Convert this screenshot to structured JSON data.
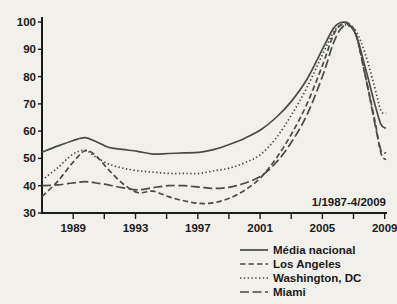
{
  "chart_data": {
    "type": "line",
    "title": "",
    "subtitle": "",
    "xlabel": "",
    "ylabel": "",
    "annotation": "1/1987-4/2009",
    "xlim": [
      1987.0,
      2009.33
    ],
    "ylim": [
      30,
      100
    ],
    "grid": false,
    "legend_position": "bottom-right",
    "y_ticks": [
      30,
      40,
      50,
      60,
      70,
      80,
      90,
      100
    ],
    "y_tick_labels": [
      "30",
      "40",
      "50",
      "60",
      "70",
      "80",
      "90",
      "100"
    ],
    "x_ticks": [
      1989,
      1991,
      1993,
      1995,
      1997,
      1999,
      2001,
      2003,
      2005,
      2007,
      2009
    ],
    "x_tick_labels": [
      "1989",
      "",
      "1993",
      "",
      "1997",
      "",
      "2001",
      "",
      "2005",
      "",
      "2009"
    ],
    "x": [
      1987.0,
      1988.0,
      1989.0,
      1989.8,
      1990.5,
      1991.3,
      1992.2,
      1993.2,
      1994.2,
      1995.2,
      1996.2,
      1997.2,
      1998.2,
      1999.2,
      2000.2,
      2001.2,
      2002.2,
      2003.2,
      2004.2,
      2005.2,
      2005.9,
      2006.4,
      2006.9,
      2007.4,
      2008.0,
      2008.6,
      2009.0,
      2009.33
    ],
    "series": [
      {
        "name": "Média nacional",
        "style": "solid",
        "values": [
          52.3,
          54.5,
          56.5,
          57.6,
          56.2,
          54.1,
          53.3,
          52.6,
          51.6,
          51.8,
          52.0,
          52.2,
          53.3,
          55.2,
          57.5,
          60.5,
          65.0,
          71.0,
          79.0,
          90.0,
          97.5,
          99.8,
          99.2,
          95.0,
          83.0,
          70.0,
          62.5,
          61.0
        ]
      },
      {
        "name": "Los Angeles",
        "style": "dashed",
        "values": [
          36.0,
          41.5,
          48.5,
          52.8,
          51.0,
          46.0,
          41.0,
          37.5,
          38.0,
          36.0,
          34.5,
          33.5,
          33.8,
          35.5,
          38.5,
          43.0,
          50.0,
          59.0,
          70.0,
          84.0,
          95.0,
          99.0,
          99.5,
          95.0,
          80.0,
          64.0,
          52.0,
          49.5
        ]
      },
      {
        "name": "Washington, DC",
        "style": "dotted",
        "values": [
          42.0,
          46.5,
          51.5,
          53.0,
          50.5,
          48.0,
          46.5,
          45.5,
          45.0,
          44.5,
          44.5,
          44.5,
          45.5,
          46.5,
          48.5,
          51.5,
          57.5,
          66.0,
          76.0,
          88.0,
          96.0,
          99.0,
          98.5,
          96.5,
          88.0,
          76.0,
          67.5,
          66.5
        ]
      },
      {
        "name": "Miami",
        "style": "dashdot",
        "values": [
          40.0,
          40.3,
          41.0,
          41.5,
          41.0,
          40.3,
          39.3,
          38.5,
          39.3,
          40.0,
          40.0,
          39.5,
          39.0,
          39.5,
          41.0,
          43.5,
          48.5,
          56.0,
          66.0,
          80.0,
          92.0,
          97.5,
          99.0,
          95.0,
          80.0,
          63.0,
          53.0,
          52.0
        ]
      }
    ]
  },
  "legend": {
    "items": [
      {
        "label": "Média nacional",
        "style": "solid"
      },
      {
        "label": "Los Angeles",
        "style": "dashed"
      },
      {
        "label": "Washington, DC",
        "style": "dotted"
      },
      {
        "label": "Miami",
        "style": "dashdot"
      }
    ]
  },
  "colors": {
    "background": "#f2f0ea",
    "ink": "#1a1a1a",
    "line": "#4a4a46"
  }
}
